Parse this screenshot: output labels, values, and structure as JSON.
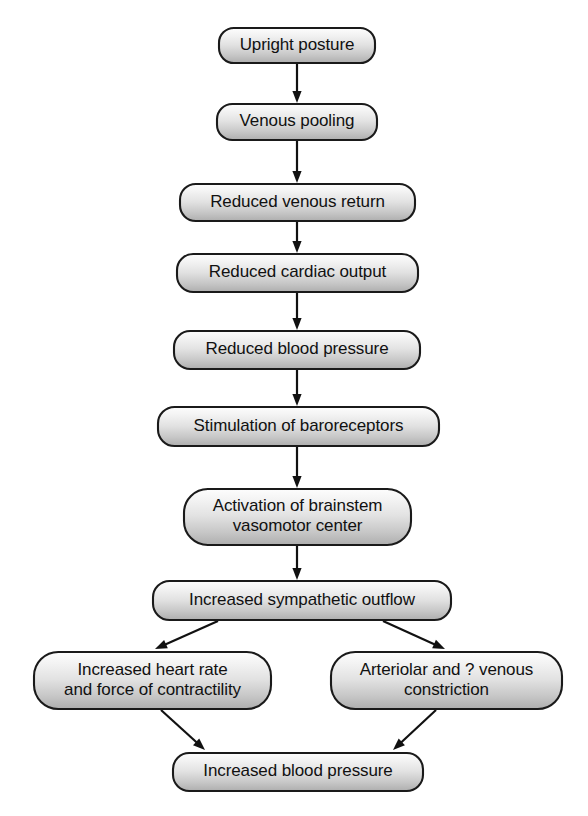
{
  "diagram": {
    "type": "flowchart",
    "orientation": "top-to-bottom",
    "background_color": "#ffffff",
    "box_fill_top": "#fbfbfb",
    "box_fill_bottom": "#b4b4b4",
    "box_border_color": "#1a1a1a",
    "text_color": "#111111",
    "arrow_color": "#111111"
  },
  "nodes": [
    {
      "id": "upright-posture",
      "label": "Upright posture",
      "lines": [
        "Upright posture"
      ],
      "x": 218,
      "y": 27,
      "w": 158,
      "h": 37
    },
    {
      "id": "venous-pooling",
      "label": "Venous pooling",
      "lines": [
        "Venous pooling"
      ],
      "x": 216,
      "y": 103,
      "w": 162,
      "h": 38
    },
    {
      "id": "reduced-venous-return",
      "label": "Reduced venous return",
      "lines": [
        "Reduced venous return"
      ],
      "x": 179,
      "y": 183,
      "w": 237,
      "h": 39
    },
    {
      "id": "reduced-cardiac-output",
      "label": "Reduced cardiac output",
      "lines": [
        "Reduced cardiac output"
      ],
      "x": 176,
      "y": 253,
      "w": 243,
      "h": 40
    },
    {
      "id": "reduced-blood-pressure",
      "label": "Reduced blood pressure",
      "lines": [
        "Reduced blood pressure"
      ],
      "x": 173,
      "y": 330,
      "w": 248,
      "h": 40
    },
    {
      "id": "stimulation-of-baroreceptors",
      "label": "Stimulation of baroreceptors",
      "lines": [
        "Stimulation of baroreceptors"
      ],
      "x": 157,
      "y": 406,
      "w": 283,
      "h": 41
    },
    {
      "id": "activation-of-brainstem-vasomotor-center",
      "label": "Activation of brainstem vasomotor center",
      "lines": [
        "Activation of brainstem",
        "vasomotor center"
      ],
      "x": 183,
      "y": 488,
      "w": 229,
      "h": 58
    },
    {
      "id": "increased-sympathetic-outflow",
      "label": "Increased sympathetic outflow",
      "lines": [
        "Increased sympathetic outflow"
      ],
      "x": 152,
      "y": 580,
      "w": 300,
      "h": 41
    },
    {
      "id": "increased-heart-rate-and-force-of-contractility",
      "label": "Increased heart rate and force of contractility",
      "lines": [
        "Increased heart rate",
        "and force of contractility"
      ],
      "x": 33,
      "y": 651,
      "w": 239,
      "h": 59
    },
    {
      "id": "arteriolar-and-venous-constriction",
      "label": "Arteriolar and ? venous constriction",
      "lines": [
        "Arteriolar and ? venous",
        "constriction"
      ],
      "x": 330,
      "y": 651,
      "w": 233,
      "h": 59
    },
    {
      "id": "increased-blood-pressure",
      "label": "Increased blood pressure",
      "lines": [
        "Increased blood pressure"
      ],
      "x": 172,
      "y": 752,
      "w": 252,
      "h": 40
    }
  ],
  "edges": [
    {
      "id": "e1",
      "from": "upright-posture",
      "to": "venous-pooling",
      "x1": 297,
      "y1": 64,
      "x2": 297,
      "y2": 103,
      "kind": "straight"
    },
    {
      "id": "e2",
      "from": "venous-pooling",
      "to": "reduced-venous-return",
      "x1": 297,
      "y1": 141,
      "x2": 297,
      "y2": 183,
      "kind": "straight"
    },
    {
      "id": "e3",
      "from": "reduced-venous-return",
      "to": "reduced-cardiac-output",
      "x1": 297,
      "y1": 222,
      "x2": 297,
      "y2": 253,
      "kind": "straight"
    },
    {
      "id": "e4",
      "from": "reduced-cardiac-output",
      "to": "reduced-blood-pressure",
      "x1": 297,
      "y1": 293,
      "x2": 297,
      "y2": 330,
      "kind": "straight"
    },
    {
      "id": "e5",
      "from": "reduced-blood-pressure",
      "to": "stimulation-of-baroreceptors",
      "x1": 297,
      "y1": 370,
      "x2": 297,
      "y2": 406,
      "kind": "straight"
    },
    {
      "id": "e6",
      "from": "stimulation-of-baroreceptors",
      "to": "activation-of-brainstem-vasomotor-center",
      "x1": 297,
      "y1": 447,
      "x2": 297,
      "y2": 488,
      "kind": "straight"
    },
    {
      "id": "e7",
      "from": "activation-of-brainstem-vasomotor-center",
      "to": "increased-sympathetic-outflow",
      "x1": 297,
      "y1": 546,
      "x2": 297,
      "y2": 580,
      "kind": "straight"
    },
    {
      "id": "e8",
      "from": "increased-sympathetic-outflow",
      "to": "increased-heart-rate-and-force-of-contractility",
      "x1": 218,
      "y1": 621,
      "x2": 155,
      "y2": 649,
      "kind": "diagonal-left"
    },
    {
      "id": "e9",
      "from": "increased-sympathetic-outflow",
      "to": "arteriolar-and-venous-constriction",
      "x1": 383,
      "y1": 621,
      "x2": 445,
      "y2": 649,
      "kind": "diagonal-right"
    },
    {
      "id": "e10",
      "from": "increased-heart-rate-and-force-of-contractility",
      "to": "increased-blood-pressure",
      "x1": 161,
      "y1": 710,
      "x2": 205,
      "y2": 750,
      "kind": "diagonal-right"
    },
    {
      "id": "e11",
      "from": "arteriolar-and-venous-constriction",
      "to": "increased-blood-pressure",
      "x1": 436,
      "y1": 710,
      "x2": 393,
      "y2": 750,
      "kind": "diagonal-left"
    }
  ]
}
